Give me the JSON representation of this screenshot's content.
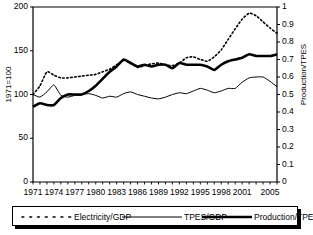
{
  "chart_data": {
    "type": "line",
    "title": "",
    "xlabel": "",
    "ylabel": "1971=100",
    "y2label": "Production/TPES",
    "xlim": [
      1971,
      2006
    ],
    "ylim": [
      0,
      200
    ],
    "y2lim": [
      0,
      1
    ],
    "grid": false,
    "legend_position": "bottom",
    "xticks": [
      "1971",
      "1974",
      "1977",
      "1980",
      "1983",
      "1986",
      "1989",
      "1992",
      "1995",
      "1998",
      "2001",
      "2005"
    ],
    "xtick_values": [
      1971,
      1974,
      1977,
      1980,
      1983,
      1986,
      1989,
      1992,
      1995,
      1998,
      2001,
      2005
    ],
    "yticks": [
      "0",
      "50",
      "100",
      "150",
      "200"
    ],
    "ytick_values": [
      0,
      50,
      100,
      150,
      200
    ],
    "y2ticks": [
      "0",
      "0.1",
      "0.2",
      "0.3",
      "0.4",
      "0.5",
      "0.6",
      "0.7",
      "0.8",
      "0.9",
      "1"
    ],
    "y2tick_values": [
      0,
      0.1,
      0.2,
      0.3,
      0.4,
      0.5,
      0.6,
      0.7,
      0.8,
      0.9,
      1
    ],
    "x": [
      1971,
      1972,
      1973,
      1974,
      1975,
      1976,
      1977,
      1978,
      1979,
      1980,
      1981,
      1982,
      1983,
      1984,
      1985,
      1986,
      1987,
      1988,
      1989,
      1990,
      1991,
      1992,
      1993,
      1994,
      1995,
      1996,
      1997,
      1998,
      1999,
      2000,
      2001,
      2002,
      2003,
      2004,
      2005,
      2006
    ],
    "series": [
      {
        "name": "Electricity/GDP",
        "axis": "left",
        "style": "dotted",
        "values": [
          100,
          110,
          126,
          122,
          119,
          119,
          120,
          121,
          122,
          123,
          126,
          129,
          134,
          139,
          136,
          131,
          133,
          135,
          136,
          134,
          133,
          136,
          142,
          143,
          140,
          138,
          143,
          151,
          163,
          175,
          186,
          193,
          190,
          183,
          176,
          170
        ]
      },
      {
        "name": "TPES/GDP",
        "axis": "left",
        "style": "thin",
        "values": [
          100,
          97,
          103,
          111,
          99,
          97,
          99,
          100,
          101,
          99,
          96,
          98,
          97,
          101,
          103,
          100,
          98,
          96,
          95,
          97,
          100,
          102,
          101,
          104,
          107,
          105,
          102,
          104,
          107,
          107,
          114,
          119,
          120,
          120,
          115,
          109
        ]
      },
      {
        "name": "Production/TPES",
        "axis": "right",
        "style": "thick",
        "values": [
          0.43,
          0.45,
          0.44,
          0.44,
          0.48,
          0.5,
          0.5,
          0.5,
          0.52,
          0.55,
          0.59,
          0.63,
          0.66,
          0.7,
          0.68,
          0.66,
          0.67,
          0.66,
          0.67,
          0.67,
          0.65,
          0.68,
          0.67,
          0.67,
          0.67,
          0.66,
          0.64,
          0.67,
          0.69,
          0.7,
          0.71,
          0.73,
          0.72,
          0.72,
          0.72,
          0.73
        ]
      }
    ]
  },
  "legend": {
    "items": [
      {
        "label": "Electricity/GDP",
        "style": "dotted"
      },
      {
        "label": "TPES/GDP",
        "style": "thin"
      },
      {
        "label": "Production/TPES",
        "style": "thick"
      }
    ]
  }
}
